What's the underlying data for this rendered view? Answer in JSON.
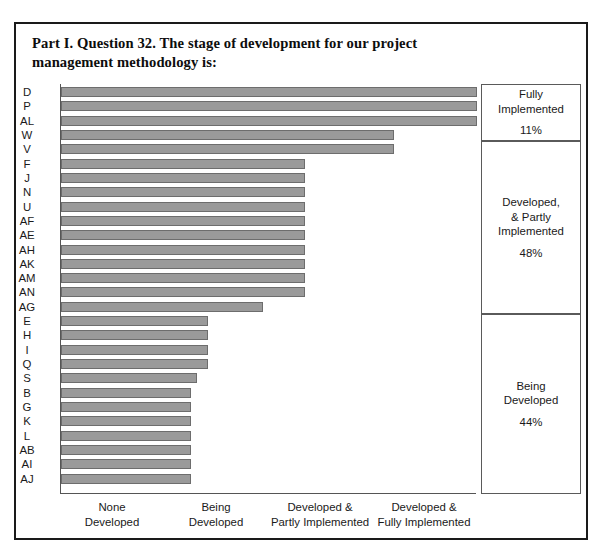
{
  "title": "Part I. Question 32. The stage of development for our project management methodology is:",
  "chart_data": {
    "type": "bar",
    "orientation": "horizontal",
    "title": "Part I. Question 32. The stage of development for our project management methodology is:",
    "xlabel": "",
    "ylabel": "",
    "grid": false,
    "xlim": [
      0,
      4
    ],
    "xtick_labels": [
      "None\nDeveloped",
      "Being\nDeveloped",
      "Developed &\nPartly Implemented",
      "Developed &\nFully Implemented"
    ],
    "categories": [
      "D",
      "P",
      "AL",
      "W",
      "V",
      "F",
      "J",
      "N",
      "U",
      "AF",
      "AE",
      "AH",
      "AK",
      "AM",
      "AN",
      "AG",
      "E",
      "H",
      "I",
      "Q",
      "S",
      "B",
      "G",
      "K",
      "L",
      "AB",
      "AI",
      "AJ"
    ],
    "values": [
      4.0,
      4.0,
      4.0,
      3.2,
      3.2,
      2.35,
      2.35,
      2.35,
      2.35,
      2.35,
      2.35,
      2.35,
      2.35,
      2.35,
      2.35,
      1.94,
      1.41,
      1.41,
      1.41,
      1.41,
      1.31,
      1.25,
      1.25,
      1.25,
      1.25,
      1.25,
      1.25,
      1.25
    ],
    "bar_color": "#9a9a9a",
    "bar_border_color": "#6d6d6d"
  },
  "legend": {
    "position": "right",
    "boxes": [
      {
        "name": "Fully\nImplemented",
        "percent": "11%"
      },
      {
        "name": "Developed,\n& Partly\nImplemented",
        "percent": "48%"
      },
      {
        "name": "Being\nDeveloped",
        "percent": "44%"
      }
    ]
  }
}
